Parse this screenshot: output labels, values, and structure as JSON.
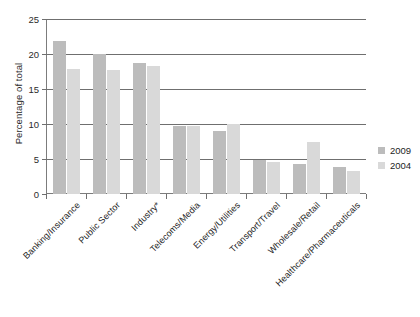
{
  "chart_data": {
    "type": "bar",
    "title": "",
    "subtitle": "",
    "xlabel": "",
    "ylabel": "Percentage of total",
    "ylim": [
      0,
      25
    ],
    "yticks": [
      0,
      5,
      10,
      15,
      20,
      25
    ],
    "ytick_labels": [
      "0",
      "5",
      "10",
      "15",
      "20",
      "25"
    ],
    "grid": true,
    "legend_position": "right",
    "categories": [
      "Banking/Insurance",
      "Public Sector",
      "Industry*",
      "Telecoms/Media",
      "Energy/Utilities",
      "Transport/Travel",
      "Wholesale/Retail",
      "Healthcare/Pharmaceuticals"
    ],
    "series": [
      {
        "name": "2009",
        "color": "#bcbcbc",
        "values": [
          21.8,
          20.0,
          18.7,
          9.7,
          9.0,
          4.9,
          4.3,
          3.8
        ]
      },
      {
        "name": "2004",
        "color": "#d9d9d9",
        "values": [
          17.8,
          17.7,
          18.3,
          9.7,
          10.0,
          4.6,
          7.4,
          3.3
        ]
      }
    ],
    "annotations": [
      "* Industry category marked with asterisk footnote"
    ]
  },
  "axis": {
    "y_title": "Percentage of total"
  },
  "legend": {
    "items": [
      {
        "label": "2009",
        "color": "#bcbcbc"
      },
      {
        "label": "2004",
        "color": "#d9d9d9"
      }
    ]
  },
  "colors": {
    "series_2009": "#bcbcbc",
    "series_2004": "#d9d9d9",
    "gridline": "#6f6f6f",
    "axis": "#7c7c7c",
    "text": "#1d1d1d",
    "background": "#ffffff"
  }
}
